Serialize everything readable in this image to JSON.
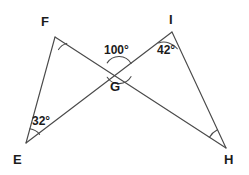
{
  "figure": {
    "background_color": "#ffffff",
    "stroke_color": "#4a4a4a",
    "text_color": "#1b1b1b",
    "width": 249,
    "height": 175
  },
  "points": {
    "F": {
      "label": "F",
      "x": 55,
      "y": 37
    },
    "I": {
      "label": "I",
      "x": 172,
      "y": 32
    },
    "G": {
      "label": "G",
      "x": 119,
      "y": 70
    },
    "E": {
      "label": "E",
      "x": 26,
      "y": 143
    },
    "H": {
      "label": "H",
      "x": 226,
      "y": 148
    }
  },
  "segments": [
    {
      "name": "E-F",
      "from": "E",
      "to": "F"
    },
    {
      "name": "F-to-H",
      "from": "F",
      "to": "H"
    },
    {
      "name": "E-to-I",
      "from": "E",
      "to": "I"
    },
    {
      "name": "I-H",
      "from": "I",
      "to": "H"
    }
  ],
  "angles": [
    {
      "name": "angle-at-G",
      "vertex": "G",
      "value": "100°",
      "measure": 100,
      "has_arc": true
    },
    {
      "name": "angle-at-I",
      "vertex": "I",
      "value": "42°",
      "measure": 42,
      "has_arc": true
    },
    {
      "name": "angle-at-E",
      "vertex": "E",
      "value": "32°",
      "measure": 32,
      "has_arc": true
    },
    {
      "name": "angle-at-F",
      "vertex": "F",
      "value": "",
      "measure": null,
      "has_arc": true
    },
    {
      "name": "angle-at-H",
      "vertex": "H",
      "value": "",
      "measure": null,
      "has_arc": true
    }
  ],
  "labels": {
    "vertex_F": "F",
    "vertex_I": "I",
    "vertex_G": "G",
    "vertex_E": "E",
    "vertex_H": "H",
    "angle_G": "100°",
    "angle_I": "42°",
    "angle_E": "32°"
  }
}
